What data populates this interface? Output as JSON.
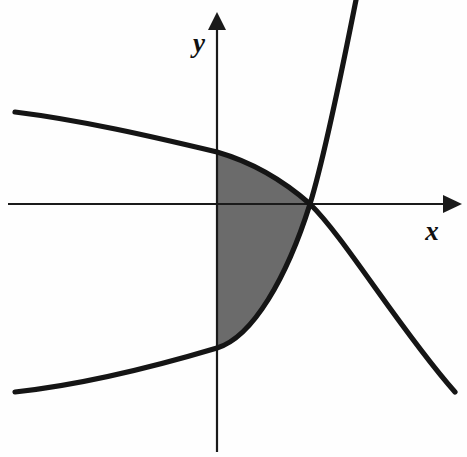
{
  "figure": {
    "background_color": "#fefefe",
    "curve_color": "#151515",
    "axis_color": "#1a1a1a",
    "shade_color": "#6b6b6b",
    "axes": {
      "x_label": "x",
      "y_label": "y",
      "origin_px": {
        "x": 310,
        "y": 204
      },
      "y_axis_x_px": 217,
      "x_axis_y_px": 204,
      "x_axis_start_px": {
        "x": 8,
        "y": 204
      },
      "x_axis_end_px": {
        "x": 458,
        "y": 204
      },
      "y_axis_start_px": {
        "x": 217,
        "y": 452
      },
      "y_axis_end_px": {
        "x": 217,
        "y": 14
      },
      "x_label_pos_px": {
        "x": 432,
        "y": 232
      },
      "y_label_pos_px": {
        "x": 196,
        "y": 45
      },
      "arrowheads": [
        "x-positive",
        "y-positive"
      ]
    },
    "curves": [
      {
        "name": "decreasing-curve",
        "description": "Concave-down decreasing curve entering from upper left, passing through the origin and falling to the lower right",
        "path": "M 15,112 C 80,120 150,136 217,152 C 255,163 285,182 310,204 C 345,238 400,330 455,392",
        "endpoints_px": [
          {
            "x": 15,
            "y": 112
          },
          {
            "x": 455,
            "y": 392
          }
        ],
        "y_axis_crossing_px": {
          "x": 217,
          "y": 152
        }
      },
      {
        "name": "increasing-curve",
        "description": "Exponential-like increasing curve entering from lower left, passing through the origin and rising steeply to the top right",
        "path": "M 15,392 C 80,385 150,368 217,348 C 253,337 287,277 310,204 C 326,152 344,60 356,0",
        "endpoints_px": [
          {
            "x": 15,
            "y": 392
          },
          {
            "x": 356,
            "y": 0
          }
        ],
        "y_axis_crossing_px": {
          "x": 217,
          "y": 348
        }
      }
    ],
    "shaded_region": {
      "name": "shaded-area",
      "description": "Gray filled region left of the y-axis between the two curves, from their y-axis crossings to the origin",
      "fill": "#6b6b6b",
      "path": "M 217,152 C 255,163 285,182 310,204 C 287,277 253,337 217,348 Z",
      "vertices_px": [
        {
          "x": 217,
          "y": 152
        },
        {
          "x": 310,
          "y": 204
        },
        {
          "x": 217,
          "y": 348
        }
      ]
    }
  }
}
